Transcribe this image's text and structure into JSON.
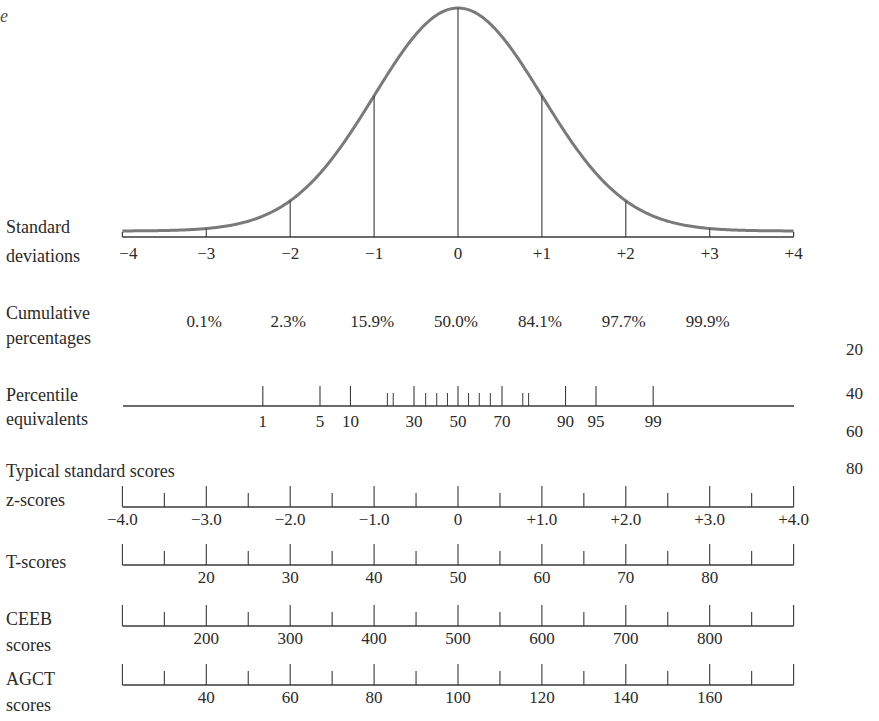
{
  "chart_data": {
    "type": "line",
    "title": "",
    "curve": {
      "x_range": [
        -4,
        4
      ],
      "mean": 0,
      "sd": 1,
      "vertical_lines_at_sd": [
        -3,
        -2,
        -1,
        0,
        1,
        2,
        3
      ]
    },
    "standard_deviations": {
      "label_line1": "Standard",
      "label_line2": "deviations",
      "values": [
        -4,
        -3,
        -2,
        -1,
        0,
        1,
        2,
        3,
        4
      ],
      "tick_labels": [
        "−4",
        "−3",
        "−2",
        "−1",
        "0",
        "+1",
        "+2",
        "+3",
        "+4"
      ]
    },
    "cumulative_percentages": {
      "label_line1": "Cumulative",
      "label_line2": "percentages",
      "at_sd": [
        -3,
        -2,
        -1,
        0,
        1,
        2,
        3
      ],
      "values": [
        "0.1%",
        "2.3%",
        "15.9%",
        "50.0%",
        "84.1%",
        "97.7%",
        "99.9%"
      ]
    },
    "percentile_equivalents": {
      "label_line1": "Percentile",
      "label_line2": "equivalents",
      "major_ticks": [
        1,
        5,
        10,
        30,
        50,
        70,
        90,
        95,
        99
      ],
      "minor_ticks": [
        20,
        40,
        60,
        80
      ],
      "minor_ticks_detail": [
        20,
        22,
        35,
        40,
        45,
        55,
        60,
        65,
        78,
        80
      ],
      "tick_labels": [
        "1",
        "5",
        "10",
        "30",
        "50",
        "70",
        "90",
        "95",
        "99"
      ]
    },
    "typical_standard_scores_heading": "Typical standard scores",
    "scales": [
      {
        "name": "z-scores",
        "label_line1": "z-scores",
        "label_line2": "",
        "labels_at_sd": [
          -4,
          -3,
          -2,
          -1,
          0,
          1,
          2,
          3,
          4
        ],
        "tick_labels": [
          "−4.0",
          "−3.0",
          "−2.0",
          "−1.0",
          "0",
          "+1.0",
          "+2.0",
          "+3.0",
          "+4.0"
        ]
      },
      {
        "name": "T-scores",
        "label_line1": "T-scores",
        "label_line2": "",
        "labels_at_sd": [
          -3,
          -2,
          -1,
          0,
          1,
          2,
          3
        ],
        "tick_labels": [
          "20",
          "30",
          "40",
          "50",
          "60",
          "70",
          "80"
        ]
      },
      {
        "name": "CEEB scores",
        "label_line1": "CEEB",
        "label_line2": "scores",
        "labels_at_sd": [
          -3,
          -2,
          -1,
          0,
          1,
          2,
          3
        ],
        "tick_labels": [
          "200",
          "300",
          "400",
          "500",
          "600",
          "700",
          "800"
        ]
      },
      {
        "name": "AGCT scores",
        "label_line1": "AGCT",
        "label_line2": "scores",
        "labels_at_sd": [
          -3,
          -2,
          -1,
          0,
          1,
          2,
          3
        ],
        "tick_labels": [
          "40",
          "60",
          "80",
          "100",
          "120",
          "140",
          "160"
        ]
      }
    ],
    "side_numbers": [
      "20",
      "40",
      "60",
      "80"
    ],
    "corner_glyph": "e",
    "colors": {
      "curve": "#7a7a7a",
      "axis": "#3a3a3a",
      "text": "#2a2a2a",
      "background": "#ffffff"
    }
  }
}
